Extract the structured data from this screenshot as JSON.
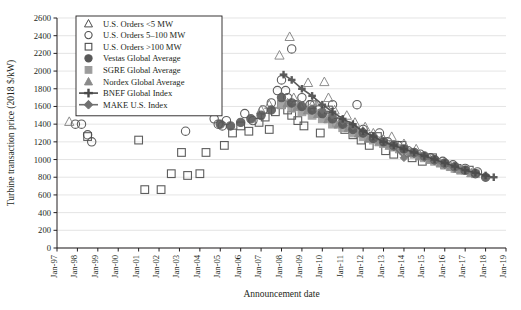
{
  "chart_data": {
    "type": "scatter",
    "title": "",
    "xlabel": "Announcement date",
    "ylabel": "Turbine transaction price (2018 $/kW)",
    "ylim": [
      0,
      2600
    ],
    "ytick_step": 200,
    "yticks": [
      0,
      200,
      400,
      600,
      800,
      1000,
      1200,
      1400,
      1600,
      1800,
      2000,
      2200,
      2400,
      2600
    ],
    "xlim": [
      "Jan-97",
      "Jan-19"
    ],
    "xticks": [
      "Jan-97",
      "Jan-98",
      "Jan-99",
      "Jan-00",
      "Jan-01",
      "Jan-02",
      "Jan-03",
      "Jan-04",
      "Jan-05",
      "Jan-06",
      "Jan-07",
      "Jan-08",
      "Jan-09",
      "Jan-10",
      "Jan-11",
      "Jan-12",
      "Jan-13",
      "Jan-14",
      "Jan-15",
      "Jan-16",
      "Jan-17",
      "Jan-18",
      "Jan-19"
    ],
    "grid": "horizontal",
    "legend_position": "top-left",
    "series": [
      {
        "name": "U.S. Orders <5 MW",
        "marker": "triangle-open",
        "color": "#808080",
        "points": [
          [
            1997.6,
            1430
          ],
          [
            2007.0,
            1560
          ],
          [
            2007.4,
            1620
          ],
          [
            2007.9,
            2180
          ],
          [
            2008.4,
            2390
          ],
          [
            2008.6,
            1700
          ],
          [
            2008.9,
            1620
          ],
          [
            2009.3,
            1870
          ],
          [
            2009.6,
            1660
          ],
          [
            2010.1,
            1880
          ],
          [
            2010.3,
            1700
          ],
          [
            2010.6,
            1560
          ],
          [
            2011.2,
            1500
          ],
          [
            2011.6,
            1420
          ],
          [
            2012.1,
            1370
          ],
          [
            2012.5,
            1300
          ],
          [
            2013.0,
            1230
          ],
          [
            2013.4,
            1260
          ],
          [
            2014.0,
            1180
          ],
          [
            2014.6,
            1120
          ]
        ]
      },
      {
        "name": "U.S. Orders 5–100 MW",
        "marker": "circle-open",
        "color": "#4d4d4d",
        "points": [
          [
            1997.9,
            1400
          ],
          [
            1998.2,
            1400
          ],
          [
            1998.5,
            1280
          ],
          [
            1998.7,
            1200
          ],
          [
            2003.3,
            1320
          ],
          [
            2004.7,
            1460
          ],
          [
            2004.9,
            1400
          ],
          [
            2005.1,
            1380
          ],
          [
            2005.3,
            1440
          ],
          [
            2006.2,
            1520
          ],
          [
            2006.6,
            1440
          ],
          [
            2007.1,
            1560
          ],
          [
            2007.5,
            1640
          ],
          [
            2007.8,
            1780
          ],
          [
            2008.0,
            1900
          ],
          [
            2008.2,
            1780
          ],
          [
            2008.3,
            1700
          ],
          [
            2008.5,
            2250
          ],
          [
            2008.7,
            1620
          ],
          [
            2009.0,
            1700
          ],
          [
            2009.4,
            1620
          ],
          [
            2009.8,
            1560
          ],
          [
            2010.2,
            1500
          ],
          [
            2010.5,
            1620
          ],
          [
            2010.9,
            1440
          ],
          [
            2011.3,
            1380
          ],
          [
            2011.7,
            1620
          ],
          [
            2012.0,
            1340
          ],
          [
            2012.4,
            1260
          ],
          [
            2012.8,
            1300
          ],
          [
            2013.2,
            1200
          ],
          [
            2013.7,
            1160
          ],
          [
            2014.2,
            1100
          ],
          [
            2014.8,
            1060
          ],
          [
            2015.3,
            1020
          ],
          [
            2015.9,
            980
          ],
          [
            2016.4,
            940
          ],
          [
            2017.0,
            900
          ],
          [
            2017.6,
            860
          ]
        ]
      },
      {
        "name": "U.S. Orders >100 MW",
        "marker": "square-open",
        "color": "#4d4d4d",
        "points": [
          [
            1998.5,
            1260
          ],
          [
            2001.0,
            1220
          ],
          [
            2001.3,
            660
          ],
          [
            2002.1,
            660
          ],
          [
            2002.6,
            840
          ],
          [
            2003.1,
            1080
          ],
          [
            2003.4,
            820
          ],
          [
            2004.0,
            840
          ],
          [
            2004.3,
            1080
          ],
          [
            2005.2,
            1160
          ],
          [
            2005.6,
            1300
          ],
          [
            2006.0,
            1380
          ],
          [
            2006.4,
            1320
          ],
          [
            2006.9,
            1420
          ],
          [
            2007.2,
            1480
          ],
          [
            2007.4,
            1340
          ],
          [
            2007.7,
            1540
          ],
          [
            2008.0,
            1620
          ],
          [
            2008.3,
            1560
          ],
          [
            2008.5,
            1500
          ],
          [
            2008.8,
            1440
          ],
          [
            2009.1,
            1380
          ],
          [
            2009.5,
            1620
          ],
          [
            2009.9,
            1300
          ],
          [
            2010.3,
            1560
          ],
          [
            2010.7,
            1420
          ],
          [
            2011.1,
            1340
          ],
          [
            2011.5,
            1280
          ],
          [
            2011.9,
            1220
          ],
          [
            2012.3,
            1160
          ],
          [
            2012.7,
            1260
          ],
          [
            2013.1,
            1100
          ],
          [
            2013.5,
            1060
          ],
          [
            2013.9,
            1160
          ],
          [
            2014.4,
            1020
          ],
          [
            2014.9,
            980
          ],
          [
            2015.4,
            1020
          ],
          [
            2016.0,
            940
          ],
          [
            2016.6,
            900
          ],
          [
            2017.2,
            880
          ]
        ]
      },
      {
        "name": "Vestas Global Average",
        "marker": "circle-filled",
        "color": "#595959",
        "points": [
          [
            2005.0,
            1400
          ],
          [
            2005.5,
            1380
          ],
          [
            2006.0,
            1420
          ],
          [
            2006.5,
            1460
          ],
          [
            2007.0,
            1500
          ],
          [
            2007.5,
            1560
          ],
          [
            2008.0,
            1700
          ],
          [
            2008.5,
            1640
          ],
          [
            2009.0,
            1600
          ],
          [
            2009.5,
            1560
          ],
          [
            2010.0,
            1520
          ],
          [
            2010.5,
            1460
          ],
          [
            2011.0,
            1400
          ],
          [
            2011.5,
            1340
          ],
          [
            2012.0,
            1300
          ],
          [
            2012.5,
            1240
          ],
          [
            2013.0,
            1200
          ],
          [
            2013.5,
            1160
          ],
          [
            2014.0,
            1120
          ],
          [
            2014.5,
            1080
          ],
          [
            2015.0,
            1040
          ],
          [
            2015.5,
            1000
          ],
          [
            2016.0,
            960
          ],
          [
            2016.5,
            920
          ],
          [
            2017.0,
            880
          ],
          [
            2017.5,
            840
          ],
          [
            2018.0,
            800
          ]
        ]
      },
      {
        "name": "SGRE Global Average",
        "marker": "square-filled",
        "color": "#9c9c9c",
        "points": [
          [
            2008.0,
            1620
          ],
          [
            2008.5,
            1580
          ],
          [
            2009.0,
            1540
          ],
          [
            2009.5,
            1500
          ],
          [
            2010.0,
            1460
          ],
          [
            2010.5,
            1400
          ],
          [
            2011.0,
            1360
          ],
          [
            2011.5,
            1300
          ],
          [
            2012.0,
            1260
          ],
          [
            2012.5,
            1220
          ],
          [
            2013.0,
            1180
          ],
          [
            2013.5,
            1140
          ],
          [
            2014.0,
            1100
          ],
          [
            2014.5,
            1060
          ],
          [
            2015.0,
            1020
          ],
          [
            2015.5,
            980
          ],
          [
            2016.0,
            940
          ],
          [
            2016.5,
            900
          ],
          [
            2017.0,
            880
          ],
          [
            2017.5,
            840
          ]
        ]
      },
      {
        "name": "Nordex Global Average",
        "marker": "triangle-filled",
        "color": "#8a8a8a",
        "points": [
          [
            2008.3,
            1640
          ],
          [
            2008.8,
            1600
          ],
          [
            2009.3,
            1560
          ],
          [
            2009.8,
            1520
          ],
          [
            2010.3,
            1460
          ],
          [
            2010.8,
            1400
          ],
          [
            2011.3,
            1360
          ],
          [
            2011.8,
            1300
          ],
          [
            2012.3,
            1240
          ],
          [
            2012.8,
            1200
          ],
          [
            2013.3,
            1160
          ],
          [
            2013.8,
            1120
          ],
          [
            2014.3,
            1080
          ],
          [
            2014.8,
            1040
          ],
          [
            2015.3,
            1000
          ],
          [
            2015.8,
            960
          ],
          [
            2016.3,
            920
          ],
          [
            2016.8,
            880
          ],
          [
            2017.3,
            850
          ]
        ]
      },
      {
        "name": "BNEF Global Index",
        "marker": "plus-line",
        "color": "#4a4a4a",
        "points": [
          [
            2008.1,
            1960
          ],
          [
            2008.5,
            1900
          ],
          [
            2009.0,
            1800
          ],
          [
            2009.5,
            1720
          ],
          [
            2010.0,
            1620
          ],
          [
            2010.5,
            1540
          ],
          [
            2011.0,
            1460
          ],
          [
            2011.5,
            1400
          ],
          [
            2012.0,
            1320
          ],
          [
            2012.5,
            1260
          ],
          [
            2013.0,
            1200
          ],
          [
            2013.5,
            1160
          ],
          [
            2014.0,
            1120
          ],
          [
            2014.5,
            1080
          ],
          [
            2015.0,
            1040
          ],
          [
            2015.5,
            1000
          ],
          [
            2016.0,
            960
          ],
          [
            2016.5,
            920
          ],
          [
            2017.0,
            880
          ],
          [
            2017.5,
            850
          ],
          [
            2018.0,
            820
          ],
          [
            2018.4,
            800
          ]
        ]
      },
      {
        "name": "MAKE U.S. Index",
        "marker": "diamond-line",
        "color": "#707070",
        "points": [
          [
            2010.0,
            1560
          ],
          [
            2010.5,
            1500
          ],
          [
            2011.0,
            1440
          ],
          [
            2011.5,
            1380
          ],
          [
            2012.0,
            1320
          ],
          [
            2012.5,
            1260
          ],
          [
            2013.0,
            1200
          ],
          [
            2013.5,
            1140
          ],
          [
            2014.0,
            1020
          ],
          [
            2014.5,
            1060
          ],
          [
            2015.0,
            1020
          ],
          [
            2015.5,
            980
          ],
          [
            2016.0,
            940
          ],
          [
            2016.5,
            900
          ],
          [
            2017.0,
            870
          ],
          [
            2017.5,
            840
          ]
        ]
      }
    ]
  },
  "legend": {
    "items": [
      {
        "label": "U.S. Orders <5 MW",
        "marker": "triangle-open"
      },
      {
        "label": "U.S. Orders 5–100 MW",
        "marker": "circle-open"
      },
      {
        "label": "U.S. Orders >100 MW",
        "marker": "square-open"
      },
      {
        "label": "Vestas Global Average",
        "marker": "circle-filled"
      },
      {
        "label": "SGRE Global Average",
        "marker": "square-filled"
      },
      {
        "label": "Nordex Global Average",
        "marker": "triangle-filled"
      },
      {
        "label": "BNEF Global Index",
        "marker": "plus-line"
      },
      {
        "label": "MAKE U.S. Index",
        "marker": "diamond-line"
      }
    ]
  },
  "colors": {
    "axis": "#231f20",
    "grid": "#d9d9d9",
    "open_marker": "#4d4d4d",
    "vestas": "#595959",
    "sgre": "#9c9c9c",
    "nordex": "#8a8a8a",
    "bnef": "#4a4a4a",
    "make": "#707070"
  }
}
